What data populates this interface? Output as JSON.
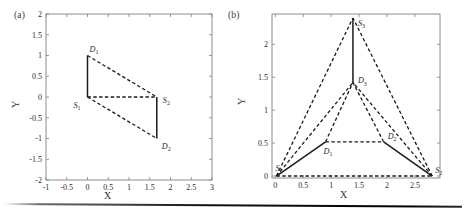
{
  "figure": {
    "background": "#ffffff",
    "line_color": "#1a1a1a",
    "axis_color": "#8c8c8c",
    "text_color": "#2b2b2b"
  },
  "panels": [
    {
      "tag": "(a)",
      "xlabel": "X",
      "ylabel": "Y",
      "xticks": [
        "-1",
        "-0.5",
        "0",
        "0.5",
        "1",
        "1.5",
        "2",
        "2.5",
        "3"
      ],
      "xtick_values": [
        -1,
        -0.5,
        0,
        0.5,
        1,
        1.5,
        2,
        2.5,
        3
      ],
      "yticks": [
        "2",
        "1.5",
        "1",
        "0.5",
        "0",
        "-0.5",
        "-1",
        "-1.5",
        "-2"
      ],
      "ytick_values": [
        2,
        1.5,
        1,
        0.5,
        0,
        -0.5,
        -1,
        -1.5,
        -2
      ],
      "xlim": [
        -1,
        3
      ],
      "ylim": [
        -2,
        2
      ],
      "point_labels": [
        "D_1",
        "S_1",
        "S_2",
        "D_2"
      ]
    },
    {
      "tag": "(b)",
      "xlabel": "X",
      "ylabel": "Y",
      "xticks": [
        "0",
        "0.5",
        "1",
        "1.5",
        "2",
        "2.5"
      ],
      "xtick_values": [
        0,
        0.5,
        1,
        1.5,
        2,
        2.5
      ],
      "yticks": [
        "0",
        "0.5",
        "1",
        "1.5",
        "2"
      ],
      "ytick_values": [
        0,
        0.5,
        1,
        1.5,
        2
      ],
      "xlim": [
        -0.06,
        2.95
      ],
      "ylim": [
        -0.03,
        2.46
      ],
      "point_labels": [
        "S_3",
        "D_3",
        "D_1",
        "D_2",
        "S_1",
        "S_2"
      ]
    }
  ],
  "chart_data": [
    {
      "type": "scatter",
      "title": "(a)",
      "xlabel": "X",
      "ylabel": "Y",
      "xlim": [
        -1,
        3
      ],
      "ylim": [
        -2,
        2
      ],
      "grid": false,
      "legend": "none",
      "points": [
        {
          "name": "S1",
          "label": "S_1",
          "x": 0.0,
          "y": 0.0,
          "label_dx": -14,
          "label_dy": 11
        },
        {
          "name": "D1",
          "label": "D_1",
          "x": 0.0,
          "y": 1.0,
          "label_dx": 2,
          "label_dy": -4
        },
        {
          "name": "S2",
          "label": "S_2",
          "x": 1.67,
          "y": 0.0,
          "label_dx": 6,
          "label_dy": 6
        },
        {
          "name": "D2",
          "label": "D_2",
          "x": 1.67,
          "y": -1.0,
          "label_dx": 5,
          "label_dy": 10
        }
      ],
      "edges": [
        {
          "from": "S1",
          "to": "D1",
          "style": "solid"
        },
        {
          "from": "S2",
          "to": "D2",
          "style": "solid"
        },
        {
          "from": "S1",
          "to": "S2",
          "style": "dashed"
        },
        {
          "from": "D1",
          "to": "S2",
          "style": "dashed"
        },
        {
          "from": "S1",
          "to": "D2",
          "style": "dashed"
        }
      ]
    },
    {
      "type": "scatter",
      "title": "(b)",
      "xlabel": "X",
      "ylabel": "Y",
      "xlim": [
        -0.06,
        2.95
      ],
      "ylim": [
        -0.03,
        2.46
      ],
      "grid": false,
      "legend": "none",
      "points": [
        {
          "name": "S1",
          "label": "S_1",
          "x": 0.02,
          "y": 0.0,
          "label_dx": -1,
          "label_dy": -5
        },
        {
          "name": "S2",
          "label": "S_2",
          "x": 2.81,
          "y": 0.0,
          "label_dx": 3,
          "label_dy": -3
        },
        {
          "name": "S3",
          "label": "S_3",
          "x": 1.39,
          "y": 2.4,
          "label_dx": 5,
          "label_dy": 8
        },
        {
          "name": "D1",
          "label": "D_1",
          "x": 0.9,
          "y": 0.52,
          "label_dx": -2,
          "label_dy": 12
        },
        {
          "name": "D2",
          "label": "D_2",
          "x": 1.94,
          "y": 0.52,
          "label_dx": 4,
          "label_dy": -3
        },
        {
          "name": "D3",
          "label": "D_3",
          "x": 1.39,
          "y": 1.42,
          "label_dx": 5,
          "label_dy": 1
        }
      ],
      "edges": [
        {
          "from": "S1",
          "to": "D1",
          "style": "solid"
        },
        {
          "from": "D2",
          "to": "S2",
          "style": "solid"
        },
        {
          "from": "S3",
          "to": "D3",
          "style": "solid"
        },
        {
          "from": "D1",
          "to": "D2",
          "style": "dashed"
        },
        {
          "from": "S1",
          "to": "S2",
          "style": "dashed"
        },
        {
          "from": "S1",
          "to": "S3",
          "style": "dashed"
        },
        {
          "from": "S2",
          "to": "S3",
          "style": "dashed"
        },
        {
          "from": "D1",
          "to": "D3",
          "style": "dashed"
        },
        {
          "from": "D2",
          "to": "D3",
          "style": "dashed"
        },
        {
          "from": "S1",
          "to": "D3",
          "style": "dashed"
        },
        {
          "from": "S2",
          "to": "D3",
          "style": "dashed"
        }
      ]
    }
  ]
}
